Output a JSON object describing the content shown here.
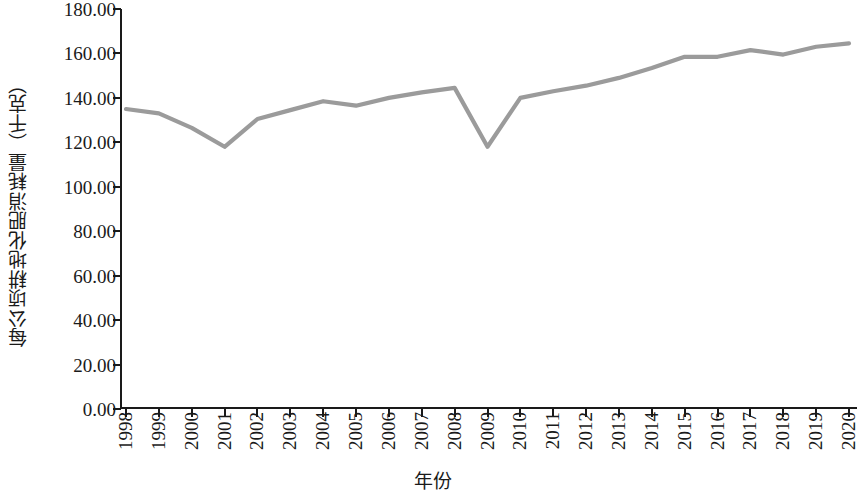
{
  "chart_data": {
    "type": "line",
    "title": "",
    "xlabel": "年份",
    "ylabel": "每公顷耕地化肥消耗量（千克）",
    "x": [
      1998,
      1999,
      2000,
      2001,
      2002,
      2003,
      2004,
      2005,
      2006,
      2007,
      2008,
      2009,
      2010,
      2011,
      2012,
      2013,
      2014,
      2015,
      2016,
      2017,
      2018,
      2019,
      2020
    ],
    "categories": [
      "1998",
      "1999",
      "2000",
      "2001",
      "2002",
      "2003",
      "2004",
      "2005",
      "2006",
      "2007",
      "2008",
      "2009",
      "2010",
      "2011",
      "2012",
      "2013",
      "2014",
      "2015",
      "2016",
      "2017",
      "2018",
      "2019",
      "2020"
    ],
    "values": [
      135.0,
      133.0,
      126.5,
      118.0,
      130.5,
      134.5,
      138.5,
      136.5,
      140.0,
      142.5,
      144.5,
      118.0,
      140.0,
      143.0,
      145.5,
      149.0,
      153.5,
      158.5,
      158.5,
      161.5,
      159.5,
      163.0,
      164.5
    ],
    "series": [
      {
        "name": "每公顷耕地化肥消耗量",
        "values": [
          135.0,
          133.0,
          126.5,
          118.0,
          130.5,
          134.5,
          138.5,
          136.5,
          140.0,
          142.5,
          144.5,
          118.0,
          140.0,
          143.0,
          145.5,
          149.0,
          153.5,
          158.5,
          158.5,
          161.5,
          159.5,
          163.0,
          164.5
        ],
        "color": "#9b9b9b"
      }
    ],
    "ylim": [
      0,
      180
    ],
    "ytick_values": [
      0,
      20,
      40,
      60,
      80,
      100,
      120,
      140,
      160,
      180
    ],
    "ytick_labels": [
      "0.00",
      "20.00",
      "40.00",
      "60.00",
      "80.00",
      "100.00",
      "120.00",
      "140.00",
      "160.00",
      "180.00"
    ],
    "grid": false,
    "legend": "none",
    "line_color": "#9b9b9b",
    "axis_color": "#1a1a1a",
    "background": "#ffffff"
  }
}
